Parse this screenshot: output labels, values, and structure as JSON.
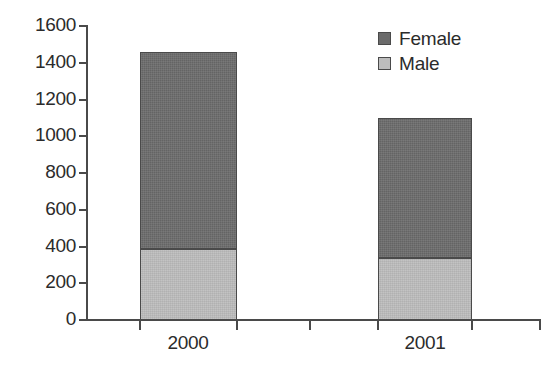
{
  "chart_data": {
    "type": "bar",
    "stacked": true,
    "title": "",
    "subtitle": "",
    "xlabel": "",
    "ylabel": "",
    "categories": [
      "2000",
      "2001"
    ],
    "series": [
      {
        "name": "Female",
        "color": "#6b6b6b",
        "values": [
          1075,
          765
        ]
      },
      {
        "name": "Male",
        "color": "#bdbdbd",
        "values": [
          385,
          335
        ]
      }
    ],
    "totals": [
      1460,
      1100
    ],
    "ylim": [
      0,
      1600
    ],
    "ytick_step": 200,
    "yticks": [
      0,
      200,
      400,
      600,
      800,
      1000,
      1200,
      1400,
      1600
    ],
    "ytick_labels": [
      "0",
      "200",
      "400",
      "600",
      "800",
      "1000",
      "1200",
      "1400",
      "1600"
    ],
    "grid": false,
    "legend_position": "top-right",
    "legend_entries": [
      "Female",
      "Male"
    ]
  },
  "axes": {
    "y_axis_name": "y-axis",
    "x_axis_name": "x-axis"
  },
  "colors": {
    "female": "#6b6b6b",
    "male": "#bdbdbd",
    "axis": "#4a4a4a",
    "text": "#2b2b2b",
    "background": "#ffffff"
  }
}
